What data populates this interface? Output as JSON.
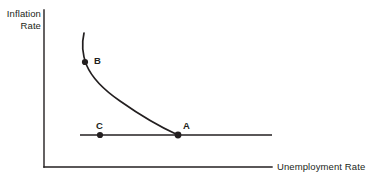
{
  "figure": {
    "background_color": "#ffffff",
    "ink_color": "#231f20"
  },
  "axes": {
    "y_label": "Inflation\nRate",
    "x_label": "Unemployment Rate",
    "y_axis_name": "inflation-rate-axis",
    "x_axis_name": "unemployment-rate-axis"
  },
  "points": {
    "a": {
      "label": "A"
    },
    "b": {
      "label": "B"
    },
    "c": {
      "label": "C"
    }
  },
  "chart_data": {
    "type": "line",
    "title": "",
    "subtitle": "",
    "xlabel": "Unemployment Rate",
    "ylabel": "Inflation Rate",
    "grid": false,
    "legend": "none",
    "xlim": [
      0,
      1
    ],
    "ylim": [
      0,
      1
    ],
    "axis_pixels": {
      "y_axis_x": 44,
      "y_axis_top_y": 10,
      "origin_y": 167,
      "x_axis_right_x": 272
    },
    "series": [
      {
        "name": "Short-run Phillips curve",
        "type": "curve",
        "style": "solid",
        "color": "#231f20",
        "points_px": [
          [
            84,
            33
          ],
          [
            83,
            45
          ],
          [
            85,
            62
          ],
          [
            92,
            73
          ],
          [
            100,
            80
          ],
          [
            112,
            91
          ],
          [
            124,
            100
          ],
          [
            138,
            110
          ],
          [
            152,
            119
          ],
          [
            165,
            127
          ],
          [
            178,
            135
          ]
        ]
      },
      {
        "name": "Long-run Phillips curve (natural rate)",
        "type": "horizontal-line",
        "style": "solid",
        "color": "#231f20",
        "points_px": [
          [
            80,
            135
          ],
          [
            272,
            135
          ]
        ]
      }
    ],
    "annotations": [
      {
        "label": "B",
        "on_series": "Short-run Phillips curve",
        "point_px": [
          85,
          62
        ],
        "label_px": [
          94,
          56
        ],
        "marker": "filled-circle"
      },
      {
        "label": "C",
        "on_series": "Long-run Phillips curve (natural rate)",
        "point_px": [
          100,
          135
        ],
        "label_px": [
          96,
          121
        ],
        "marker": "filled-circle"
      },
      {
        "label": "A",
        "on_series": "intersection",
        "point_px": [
          178,
          135
        ],
        "label_px": [
          183,
          121
        ],
        "marker": "filled-circle"
      }
    ]
  }
}
